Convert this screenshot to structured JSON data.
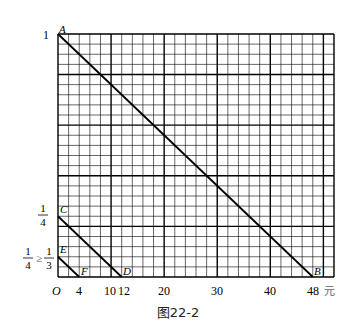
{
  "figure": {
    "caption": "图22-2",
    "x_unit_label": "元",
    "origin_label": "O"
  },
  "grid": {
    "left": 58,
    "top": 34,
    "right": 334,
    "bottom": 277,
    "x_per_unit": 5.31,
    "cols": 26,
    "col_units": 2,
    "thick_every_cols": 5,
    "rows": 24,
    "thick_every_rows_from_bottom": 5,
    "line_color": "#000000"
  },
  "chart_data": {
    "type": "line",
    "title": "图22-2",
    "xlabel": "元",
    "ylabel": "",
    "xlim": [
      0,
      52
    ],
    "ylim": [
      0,
      1
    ],
    "x_ticks": [
      {
        "value": 4,
        "label": "4"
      },
      {
        "value": 10,
        "label": "10"
      },
      {
        "value": 12,
        "label": "12"
      },
      {
        "value": 20,
        "label": "20"
      },
      {
        "value": 30,
        "label": "30"
      },
      {
        "value": 40,
        "label": "40"
      },
      {
        "value": 48,
        "label": "48"
      }
    ],
    "y_ticks": [
      {
        "value": 1,
        "label": "1"
      },
      {
        "value": 0.25,
        "label": "1/4"
      },
      {
        "value": 0.0833,
        "label": "1/4 ≥ 1/3"
      }
    ],
    "series": [
      {
        "name": "AB",
        "points": [
          {
            "label": "A",
            "x": 0,
            "y": 1
          },
          {
            "label": "B",
            "x": 48,
            "y": 0
          }
        ]
      },
      {
        "name": "CD",
        "points": [
          {
            "label": "C",
            "x": 0,
            "y": 0.25
          },
          {
            "label": "D",
            "x": 12,
            "y": 0
          }
        ]
      },
      {
        "name": "EF",
        "points": [
          {
            "label": "E",
            "x": 0,
            "y": 0.0833
          },
          {
            "label": "F",
            "x": 4,
            "y": 0
          }
        ]
      }
    ],
    "grid": true,
    "legend": "none"
  },
  "labels": {
    "y_one": "1",
    "y_quarter_num": "1",
    "y_quarter_den": "4",
    "y_e_left_num": "1",
    "y_e_left_den": "4",
    "y_e_rel": "≥",
    "y_e_right_num": "1",
    "y_e_right_den": "3",
    "point_A": "A",
    "point_B": "B",
    "point_C": "C",
    "point_D": "D",
    "point_E": "E",
    "point_F": "F",
    "x4": "4",
    "x10": "10",
    "x12": "12",
    "x20": "20",
    "x30": "30",
    "x40": "40",
    "x48": "48"
  }
}
